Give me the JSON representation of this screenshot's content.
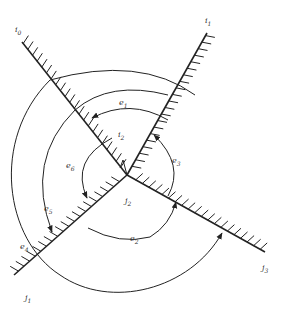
{
  "diagram": {
    "title": "",
    "colors": {
      "stroke": "#222222",
      "label": "#333333",
      "background": "#ffffff"
    },
    "center": {
      "label": "j2",
      "x": 127,
      "y": 175
    },
    "rays": [
      {
        "id": "i0",
        "label": "i0",
        "end": [
          22,
          42
        ]
      },
      {
        "id": "i1",
        "label": "i1",
        "end": [
          207,
          33
        ]
      },
      {
        "id": "j1",
        "label": "j1",
        "end": [
          14,
          275
        ]
      },
      {
        "id": "j3",
        "label": "j3",
        "end": [
          265,
          252
        ]
      }
    ],
    "labels": {
      "i0": "i0",
      "i1": "i1",
      "i2": "i2",
      "j1": "j1",
      "j2": "j2",
      "j3": "j3",
      "e1": "e1",
      "e2": "e2",
      "e3": "e3",
      "e4": "e4",
      "e5": "e5",
      "e6": "e6"
    },
    "arcs": [
      {
        "id": "e1",
        "from": "i1",
        "to": "i0",
        "direction": "counterclockwise"
      },
      {
        "id": "e2",
        "from": "j1",
        "to": "j3",
        "direction": "counterclockwise"
      },
      {
        "id": "e3",
        "from": "j3",
        "to": "i1",
        "direction": "counterclockwise"
      },
      {
        "id": "e4",
        "from": "i0",
        "to": "j3",
        "direction": "counterclockwise"
      },
      {
        "id": "e5",
        "from": "i0",
        "to": "j1",
        "direction": "counterclockwise"
      },
      {
        "id": "e6",
        "from": "i0",
        "to": "j1",
        "direction": "counterclockwise"
      }
    ]
  }
}
